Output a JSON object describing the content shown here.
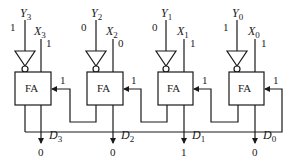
{
  "diagram": {
    "block_label": "FA",
    "stages": [
      {
        "index": 3,
        "y_name": "Y",
        "y_sub": "3",
        "y_bit": "1",
        "x_name": "X",
        "x_sub": "3",
        "x_bit": "1",
        "carry_in": "1",
        "d_name": "D",
        "d_sub": "3",
        "d_bit": "0"
      },
      {
        "index": 2,
        "y_name": "Y",
        "y_sub": "2",
        "y_bit": "0",
        "x_name": "X",
        "x_sub": "2",
        "x_bit": "0",
        "carry_in": "1",
        "d_name": "D",
        "d_sub": "2",
        "d_bit": "0"
      },
      {
        "index": 1,
        "y_name": "Y",
        "y_sub": "1",
        "y_bit": "0",
        "x_name": "X",
        "x_sub": "1",
        "x_bit": "1",
        "carry_in": "1",
        "d_name": "D",
        "d_sub": "1",
        "d_bit": "1"
      },
      {
        "index": 0,
        "y_name": "Y",
        "y_sub": "0",
        "y_bit": "1",
        "x_name": "X",
        "x_sub": "0",
        "x_bit": "1",
        "carry_in": "1",
        "d_name": "D",
        "d_sub": "0",
        "d_bit": "0"
      }
    ],
    "colors": {
      "line": "#1a1a1a",
      "background": "#ffffff"
    }
  }
}
